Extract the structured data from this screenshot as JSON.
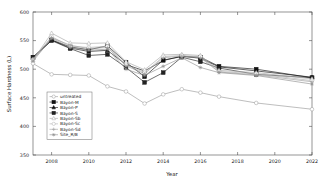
{
  "chart_data": {
    "type": "line",
    "title": "",
    "xlabel": "Year",
    "ylabel": "Surface Hardness  (L)",
    "xlim": [
      2007,
      2022
    ],
    "ylim": [
      350,
      600
    ],
    "xticks": [
      2008,
      2010,
      2012,
      2014,
      2016,
      2018,
      2020,
      2022
    ],
    "yticks": [
      350,
      400,
      450,
      500,
      550,
      600
    ],
    "grid": false,
    "legend_position": "lower-left-inside",
    "x": [
      2007,
      2008,
      2009,
      2010,
      2011,
      2012,
      2013,
      2014,
      2015,
      2016,
      2017,
      2019,
      2022
    ],
    "series": [
      {
        "name": "untreated",
        "marker": "circle-open",
        "color": "#9a9a9a",
        "filled": false,
        "values": [
          510,
          491,
          490,
          489,
          470,
          461,
          440,
          456,
          465,
          459,
          452,
          441,
          430
        ]
      },
      {
        "name": "Bayon-M",
        "marker": "square-filled",
        "color": "#111111",
        "filled": true,
        "values": [
          521,
          551,
          539,
          534,
          541,
          512,
          487,
          516,
          522,
          521,
          505,
          500,
          485
        ]
      },
      {
        "name": "Bayon-P",
        "marker": "triangle-filled",
        "color": "#111111",
        "filled": true,
        "values": [
          519,
          551,
          537,
          531,
          533,
          508,
          497,
          515,
          523,
          519,
          504,
          497,
          486
        ]
      },
      {
        "name": "Bayon-S",
        "marker": "square-filled",
        "color": "#222222",
        "filled": true,
        "values": [
          521,
          550,
          536,
          524,
          526,
          503,
          477,
          494,
          521,
          513,
          502,
          491,
          485
        ]
      },
      {
        "name": "Bayon-Sb",
        "marker": "triangle-open",
        "color": "#a8a8a8",
        "filled": false,
        "values": [
          516,
          563,
          546,
          545,
          546,
          513,
          499,
          525,
          526,
          524,
          498,
          494,
          483
        ]
      },
      {
        "name": "Bayon-Sc",
        "marker": "circle-open",
        "color": "#b0b0b0",
        "filled": false,
        "values": [
          517,
          557,
          540,
          538,
          540,
          508,
          494,
          522,
          524,
          522,
          496,
          492,
          480
        ]
      },
      {
        "name": "Bayon-Sd",
        "marker": "plus-open",
        "color": "#9e9e9e",
        "filled": false,
        "values": [
          518,
          555,
          542,
          536,
          538,
          506,
          492,
          520,
          523,
          520,
          495,
          490,
          478
        ]
      },
      {
        "name": "Site_R/B",
        "marker": "star-open",
        "color": "#8f8f8f",
        "filled": false,
        "values": [
          514,
          554,
          538,
          533,
          535,
          500,
          489,
          505,
          520,
          503,
          494,
          489,
          474
        ]
      }
    ]
  },
  "colors": {
    "axis": "#4d4d4d",
    "text": "#1a1a1a",
    "background": "#ffffff",
    "legend_border": "#6b6b6b"
  }
}
